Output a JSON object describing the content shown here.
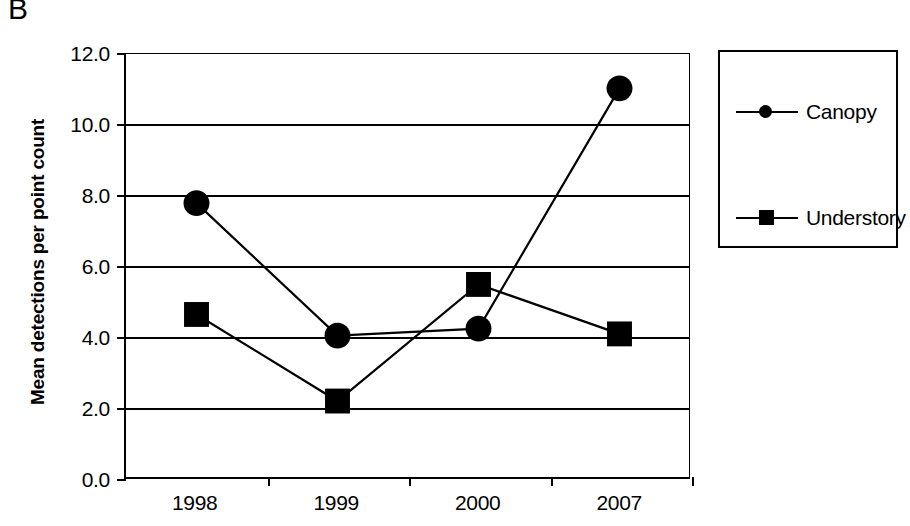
{
  "panel": {
    "label": "B"
  },
  "chart_data": {
    "type": "line",
    "title": "",
    "subtitle": "",
    "xlabel": "",
    "ylabel": "Mean detections per point count",
    "categories": [
      "1998",
      "1999",
      "2000",
      "2007"
    ],
    "series": [
      {
        "name": "Canopy",
        "marker": "circle",
        "values": [
          7.75,
          4.0,
          4.2,
          11.0
        ]
      },
      {
        "name": "Understory",
        "marker": "square",
        "values": [
          4.6,
          2.15,
          5.45,
          4.05
        ]
      }
    ],
    "ylim": [
      0.0,
      12.0
    ],
    "ytick_labels": [
      "12.0",
      "10.0",
      "8.0",
      "6.0",
      "4.0",
      "2.0",
      "0.0"
    ],
    "ytick_values": [
      12.0,
      10.0,
      8.0,
      6.0,
      4.0,
      2.0,
      0.0
    ],
    "grid": true,
    "grid_axis": "y",
    "legend_position": "right",
    "line_color": "#000000",
    "marker_color": "#000000",
    "background_color": "#ffffff"
  },
  "legend": {
    "entries": [
      {
        "label": "Canopy",
        "marker": "circle"
      },
      {
        "label": "Understory",
        "marker": "square"
      }
    ]
  }
}
